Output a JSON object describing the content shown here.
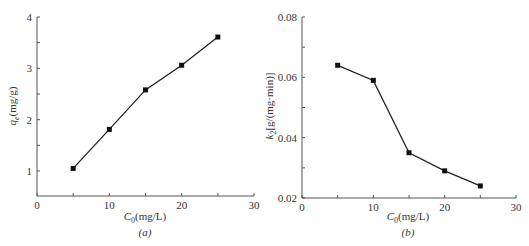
{
  "chart_data": [
    {
      "id": "a",
      "type": "line",
      "title": "",
      "caption": "(a)",
      "xlabel": "C0(mg/L)",
      "ylabel": "qe(mg/g)",
      "x": [
        5,
        10,
        15,
        20,
        25
      ],
      "series": [
        {
          "name": "qe",
          "values": [
            1.05,
            1.81,
            2.58,
            3.06,
            3.61
          ]
        }
      ],
      "xlim": [
        0,
        30
      ],
      "ylim": [
        0.5,
        4
      ],
      "xticks": [
        0,
        10,
        20,
        30
      ],
      "yticks": [
        1,
        2,
        3,
        4
      ],
      "grid": false,
      "legend": null,
      "marker": "square"
    },
    {
      "id": "b",
      "type": "line",
      "title": "",
      "caption": "(b)",
      "xlabel": "C0(mg/L)",
      "ylabel": "k2[g/(mg·min)]",
      "x": [
        5,
        10,
        15,
        20,
        25
      ],
      "series": [
        {
          "name": "k2",
          "values": [
            0.064,
            0.059,
            0.035,
            0.029,
            0.024
          ]
        }
      ],
      "xlim": [
        0,
        30
      ],
      "ylim": [
        0.02,
        0.08
      ],
      "xticks": [
        0,
        10,
        20,
        30
      ],
      "yticks": [
        0.02,
        0.04,
        0.06,
        0.08
      ],
      "grid": false,
      "legend": null,
      "marker": "square"
    }
  ],
  "labels": {
    "a": {
      "caption": "(a)",
      "xlabel_main": "C",
      "xlabel_sub": "0",
      "xlabel_unit": "(mg/L)",
      "ylabel_main": "q",
      "ylabel_sub": "e",
      "ylabel_unit": "(mg/g)",
      "xticks": [
        "0",
        "10",
        "20",
        "30"
      ],
      "yticks": [
        "1",
        "2",
        "3",
        "4"
      ]
    },
    "b": {
      "caption": "(b)",
      "xlabel_main": "C",
      "xlabel_sub": "0",
      "xlabel_unit": "(mg/L)",
      "ylabel_main": "k",
      "ylabel_sub": "2",
      "ylabel_unit": "[g/(mg·min)]",
      "xticks": [
        "0",
        "10",
        "20",
        "30"
      ],
      "yticks": [
        "0.02",
        "0.04",
        "0.06",
        "0.08"
      ]
    }
  }
}
